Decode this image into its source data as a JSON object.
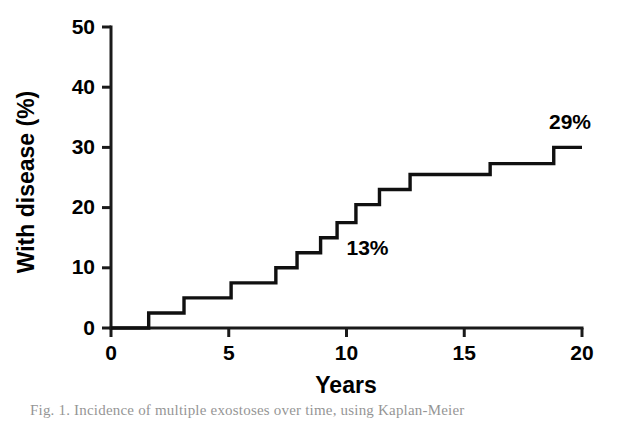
{
  "figure": {
    "caption": "Fig. 1. Incidence of multiple exostoses over time, using Kaplan-Meier",
    "background_color": "#ffffff",
    "line_color": "#101010"
  },
  "chart_data": {
    "type": "line",
    "title": "",
    "subtitle": "",
    "xlabel": "Years",
    "ylabel": "With disease (%)",
    "xlim": [
      0,
      20
    ],
    "ylim": [
      0,
      50
    ],
    "xticks": [
      0,
      5,
      10,
      15,
      20
    ],
    "yticks": [
      0,
      10,
      20,
      30,
      40,
      50
    ],
    "xtick_labels": [
      "0",
      "5",
      "10",
      "15",
      "20"
    ],
    "ytick_labels": [
      "0",
      "10",
      "20",
      "30",
      "40",
      "50"
    ],
    "grid": false,
    "legend": false,
    "legend_position": "none",
    "step_style": "post",
    "series": [
      {
        "name": "Cumulative incidence",
        "x": [
          0,
          1.6,
          3.1,
          5.1,
          7.0,
          7.9,
          8.9,
          9.6,
          10.4,
          11.4,
          12.7,
          16.1,
          18.8,
          20
        ],
        "values": [
          0,
          2.5,
          5.0,
          7.5,
          10.0,
          12.5,
          15.0,
          17.5,
          20.5,
          23.0,
          25.5,
          27.3,
          30.0,
          30.0
        ]
      }
    ],
    "annotations": [
      {
        "text": "13%",
        "x": 10.0,
        "y": 12.2
      },
      {
        "text": "29%",
        "x": 18.6,
        "y": 33.0
      }
    ]
  }
}
